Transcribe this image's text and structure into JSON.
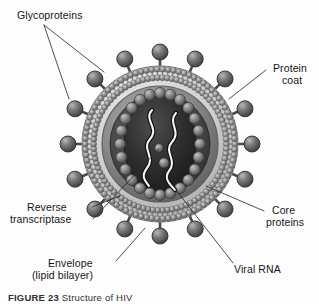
{
  "figure": {
    "background_color": "#fdfdfd",
    "ink_color": "#161616"
  },
  "labels": {
    "glycoproteins": "Glycoproteins",
    "protein_coat_line1": "Protein",
    "protein_coat_line2": "coat",
    "core_proteins_line1": "Core",
    "core_proteins_line2": "proteins",
    "reverse_transcriptase_line1": "Reverse",
    "reverse_transcriptase_line2": "transcriptase",
    "envelope_line1": "Envelope",
    "envelope_line2": "(lipid bilayer)",
    "viral_rna": "Viral RNA"
  },
  "caption": {
    "figure_number": "FIGURE 23",
    "text": "Structure of HIV"
  },
  "structure": {
    "center_x": 160,
    "center_y": 144,
    "envelope_outer_radius": 78,
    "envelope_inner_radius": 64,
    "protein_coat_radius": 57,
    "capsid_radius_x": 34,
    "capsid_radius_y": 46,
    "spike_count": 16,
    "spike_stalk_length": 14,
    "spike_head_radius": 8,
    "core_protein_count": 24,
    "core_protein_radius": 5.5,
    "rna_strand_count": 2,
    "enzyme_count": 2,
    "colors": {
      "spike_head": "#6e6e6e",
      "spike_head_dark": "#4c4c4c",
      "lipid_head": "#9a9a9a",
      "envelope_band": "#cfcfcf",
      "protein_coat": "#8e8e8e",
      "core_interior": "#3a3a3a",
      "capsid": "#2b2b2b",
      "core_protein": "#8a8a8a",
      "rna": "#f2f2f2",
      "leader_line": "#3a3a3a"
    }
  }
}
